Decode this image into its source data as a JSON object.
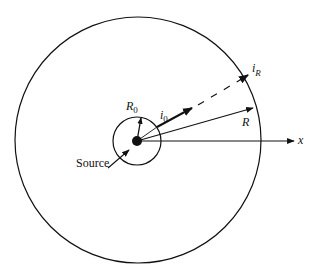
{
  "diagram": {
    "type": "radial source geometry",
    "labels": {
      "source": "Source",
      "inner_radius": "R",
      "inner_radius_sub": "0",
      "inner_current": "i",
      "inner_current_sub": "0",
      "outer_current": "i",
      "outer_current_sub": "R",
      "outer_radius": "R",
      "axis": "x"
    },
    "colors": {
      "stroke": "#111111",
      "background": "#ffffff"
    }
  }
}
